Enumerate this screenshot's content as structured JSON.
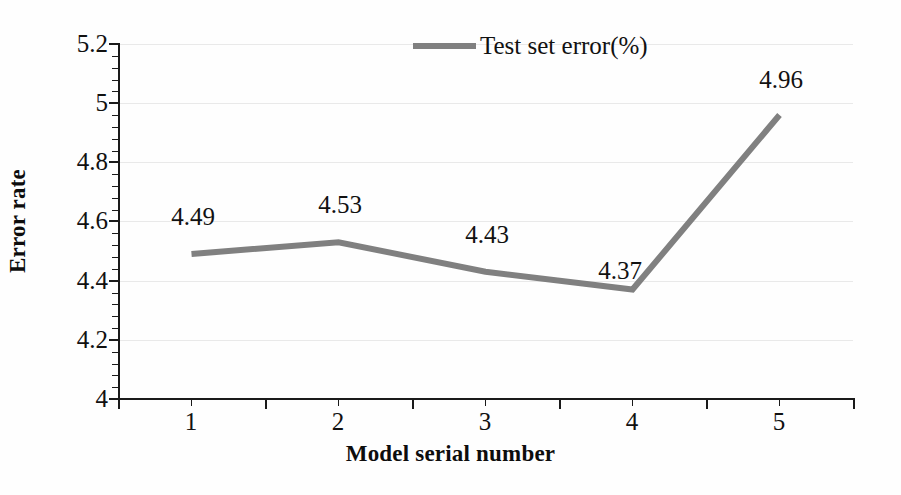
{
  "chart_data": {
    "type": "line",
    "title": "",
    "xlabel": "Model serial number",
    "ylabel": "Error rate",
    "categories": [
      "1",
      "2",
      "3",
      "4",
      "5"
    ],
    "series": [
      {
        "name": "Test set error(%)",
        "color": "#808080",
        "values": [
          4.49,
          4.53,
          4.43,
          4.37,
          4.96
        ]
      }
    ],
    "data_labels": [
      "4.49",
      "4.53",
      "4.43",
      "4.37",
      "4.96"
    ],
    "ylim": [
      4,
      5.2
    ],
    "y_ticks": [
      "4",
      "4.2",
      "4.4",
      "4.6",
      "4.8",
      "5",
      "5.2"
    ],
    "y_tick_values": [
      4,
      4.2,
      4.4,
      4.6,
      4.8,
      5,
      5.2
    ],
    "y_minor_tick_step": 0.04,
    "grid": "horizontal-major-only",
    "grid_color": "#e9e9e9",
    "legend": {
      "position": "top-center",
      "entries": [
        "Test set error(%)"
      ]
    },
    "axis_color": "#1a1a1a",
    "background": "#fefefe"
  },
  "legend": {
    "label": "Test set error(%)"
  },
  "axes": {
    "y_title": "Error rate",
    "x_title": "Model serial number",
    "y_labels": [
      "5.2",
      "5",
      "4.8",
      "4.6",
      "4.4",
      "4.2",
      "4"
    ],
    "x_labels": [
      "1",
      "2",
      "3",
      "4",
      "5"
    ]
  },
  "labels": {
    "p1": "4.49",
    "p2": "4.53",
    "p3": "4.43",
    "p4": "4.37",
    "p5": "4.96"
  }
}
